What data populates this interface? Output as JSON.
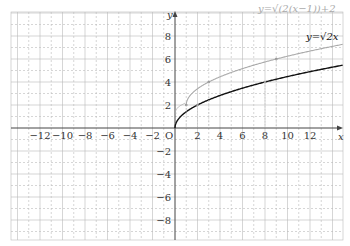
{
  "chart_data": {
    "type": "line",
    "title": "",
    "xlabel": "x",
    "ylabel": "y",
    "origin_label": "O",
    "xlim": [
      -14.6,
      14.9
    ],
    "ylim": [
      -9.7,
      10.1
    ],
    "grid": true,
    "x_ticks": [
      -12,
      -10,
      -8,
      -6,
      -4,
      -2,
      2,
      4,
      6,
      8,
      10,
      12
    ],
    "y_ticks": [
      -8,
      -6,
      -4,
      -2,
      2,
      4,
      6,
      8
    ],
    "series": [
      {
        "name": "y=√2x",
        "label": "y=√2x",
        "color": "#111111",
        "formula": "sqrt(2x)",
        "domain": [
          0,
          14.9
        ],
        "marked_points": [
          [
            2,
            2
          ],
          [
            8,
            4
          ]
        ]
      },
      {
        "name": "y=√(2(x−1))+2",
        "label": "y=√(2(x−1))+2",
        "color": "#aaaaaa",
        "formula": "sqrt(2(x-1))+2",
        "domain": [
          1,
          14.9
        ],
        "marked_points": [
          [
            1,
            2
          ],
          [
            3,
            4
          ],
          [
            9,
            6
          ]
        ]
      }
    ],
    "annotations": [
      {
        "type": "arrow",
        "from": [
          0,
          0
        ],
        "to": [
          1,
          2
        ],
        "note": "translation arrow from origin toward (1,2)"
      }
    ]
  },
  "colors": {
    "axis": "#444444",
    "grid": "#bbbbbb",
    "curve_main": "#111111",
    "curve_shifted": "#aaaaaa"
  }
}
